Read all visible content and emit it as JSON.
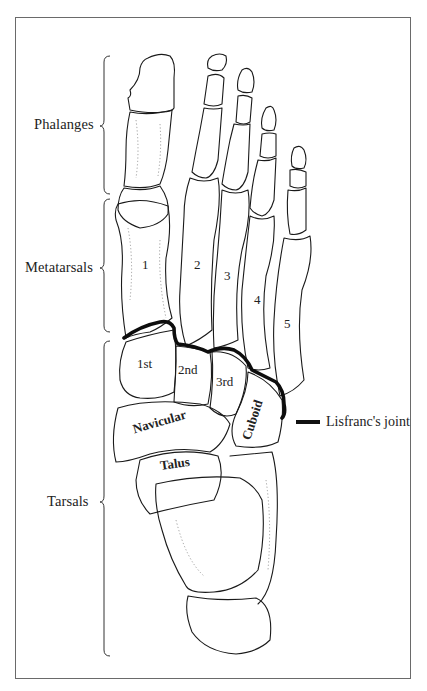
{
  "figure": {
    "type": "anatomical line drawing"
  },
  "regions": [
    {
      "label": "Phalanges"
    },
    {
      "label": "Metatarsals"
    },
    {
      "label": "Tarsals"
    }
  ],
  "metatarsal_numbers": [
    "1",
    "2",
    "3",
    "4",
    "5"
  ],
  "tarsal_bones": {
    "cuneiform_1": "1st",
    "cuneiform_2": "2nd",
    "cuneiform_3": "3rd",
    "navicular": "Navicular",
    "cuboid": "Cuboid",
    "talus": "Talus"
  },
  "legend": {
    "label": "Lisfranc's joint",
    "color": "#111111"
  },
  "colors": {
    "background": "#ffffff",
    "frame": "#6a6a6a",
    "ink": "#1a1a1a"
  }
}
